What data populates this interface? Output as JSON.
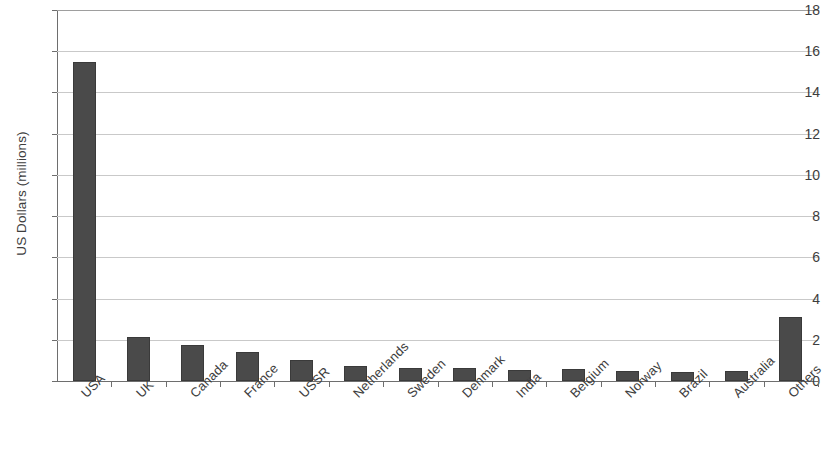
{
  "chart_data": {
    "type": "bar",
    "title": "",
    "xlabel": "",
    "ylabel": "US Dollars (millions)",
    "ylim": [
      0,
      18
    ],
    "yticks": [
      0,
      2,
      4,
      6,
      8,
      10,
      12,
      14,
      16,
      18
    ],
    "grid": true,
    "legend": false,
    "bar_color": "#4a4a4a",
    "gridline_color": "#c9c9c9",
    "axis_color": "#6e6e6e",
    "background_color": "#ffffff",
    "categories": [
      "USA",
      "UK",
      "Canada",
      "France",
      "USSR",
      "Netherlands",
      "Sweden",
      "Denmark",
      "India",
      "Belgium",
      "Norway",
      "Brazil",
      "Australia",
      "Others"
    ],
    "values": [
      15.5,
      2.15,
      1.75,
      1.4,
      1.0,
      0.75,
      0.65,
      0.62,
      0.55,
      0.58,
      0.5,
      0.45,
      0.47,
      3.1
    ]
  }
}
